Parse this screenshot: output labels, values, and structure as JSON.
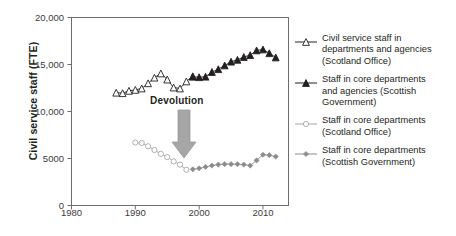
{
  "chart_data": {
    "type": "line",
    "title": "",
    "xlabel": "",
    "ylabel": "Civil service staff (FTE)",
    "xlim": [
      1980,
      2014
    ],
    "ylim": [
      0,
      20000
    ],
    "xticks": [
      1980,
      1990,
      2000,
      2010
    ],
    "xtick_labels": [
      "1980",
      "1990",
      "2000",
      "2010"
    ],
    "yticks": [
      0,
      5000,
      10000,
      15000,
      20000
    ],
    "ytick_labels": [
      "0",
      "5000",
      "10,000",
      "15,000",
      "20,000"
    ],
    "grid": false,
    "legend_position": "right",
    "annotations": [
      {
        "text": "Devolution",
        "x": 1999,
        "y": 10200,
        "arrow": "down",
        "arrow_color": "#a6a6a6"
      }
    ],
    "series": [
      {
        "name": "Civil service staff in departments and agencies (Scotland Office)",
        "marker": "open-triangle",
        "color": "#231f20",
        "x": [
          1987,
          1988,
          1989,
          1990,
          1991,
          1992,
          1993,
          1994,
          1995,
          1996,
          1997,
          1998,
          1999
        ],
        "values": [
          12000,
          11950,
          12200,
          12300,
          12450,
          13000,
          13600,
          14050,
          13400,
          12550,
          12450,
          13200,
          13750
        ]
      },
      {
        "name": "Staff in core departments and agencies (Scottish Government)",
        "marker": "filled-triangle",
        "color": "#231f20",
        "x": [
          1999,
          2000,
          2001,
          2002,
          2003,
          2004,
          2005,
          2006,
          2007,
          2008,
          2009,
          2010,
          2011,
          2012
        ],
        "values": [
          13700,
          13650,
          13700,
          14200,
          14500,
          14900,
          15300,
          15500,
          15800,
          16000,
          16500,
          16600,
          16200,
          15750
        ]
      },
      {
        "name": "Staff in core departments (Scotland Office)",
        "marker": "open-circle",
        "color": "#a6a6a6",
        "x": [
          1990,
          1991,
          1992,
          1993,
          1994,
          1995,
          1996,
          1997,
          1998
        ],
        "values": [
          6700,
          6650,
          6300,
          5900,
          5500,
          5150,
          4700,
          4350,
          3800
        ]
      },
      {
        "name": "Staff in core departments (Scottish Government)",
        "marker": "filled-diamond",
        "color": "#8c8c8c",
        "x": [
          1999,
          2000,
          2001,
          2002,
          2003,
          2004,
          2005,
          2006,
          2007,
          2008,
          2009,
          2010,
          2011,
          2012
        ],
        "values": [
          3850,
          3950,
          4100,
          4250,
          4350,
          4400,
          4400,
          4400,
          4350,
          4250,
          4800,
          5400,
          5350,
          5200
        ]
      }
    ]
  },
  "axis": {
    "y_title": "Civil service staff (FTE)"
  },
  "legend": {
    "items": [
      {
        "marker": "open-triangle",
        "lines": [
          "Civil service staff in",
          "departments and agencies",
          "(Scotland Office)"
        ]
      },
      {
        "marker": "filled-triangle",
        "lines": [
          "Staff in core departments",
          "and agencies (Scottish",
          "Government)"
        ]
      },
      {
        "marker": "open-circle",
        "lines": [
          "Staff in core departments",
          "(Scotland Office)"
        ]
      },
      {
        "marker": "filled-diamond",
        "lines": [
          "Staff in core departments",
          "(Scottish Government)"
        ]
      }
    ]
  },
  "annotation": {
    "devolution_label": "Devolution"
  },
  "colors": {
    "frame": "#6d6d6d",
    "dark_series": "#231f20",
    "light_series": "#a6a6a6",
    "mid_series": "#8c8c8c",
    "arrow": "#a6a6a6",
    "text": "#231f20"
  }
}
